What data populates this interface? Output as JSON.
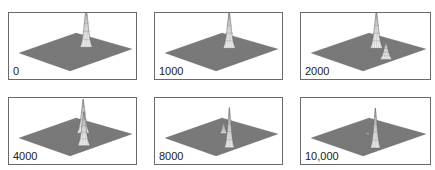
{
  "figure": {
    "panels": [
      {
        "label": "0",
        "peaks": [
          {
            "x": 0.5,
            "y": 0.3,
            "height": 1.0,
            "width": 0.05
          }
        ]
      },
      {
        "label": "1000",
        "peaks": [
          {
            "x": 0.5,
            "y": 0.35,
            "height": 0.95,
            "width": 0.05
          }
        ]
      },
      {
        "label": "2000",
        "peaks": [
          {
            "x": 0.5,
            "y": 0.35,
            "height": 0.95,
            "width": 0.05
          },
          {
            "x": 0.9,
            "y": 0.55,
            "height": 0.45,
            "width": 0.05
          }
        ]
      },
      {
        "label": "4000",
        "peaks": [
          {
            "x": 0.5,
            "y": 0.35,
            "height": 0.85,
            "width": 0.05
          },
          {
            "x": 0.85,
            "y": 0.65,
            "height": 0.85,
            "width": 0.05
          }
        ]
      },
      {
        "label": "8000",
        "peaks": [
          {
            "x": 0.45,
            "y": 0.4,
            "height": 0.3,
            "width": 0.03
          },
          {
            "x": 0.9,
            "y": 0.7,
            "height": 1.0,
            "width": 0.04
          }
        ]
      },
      {
        "label": "10,000",
        "peaks": [
          {
            "x": 0.45,
            "y": 0.45,
            "height": 0.08,
            "width": 0.02
          },
          {
            "x": 0.9,
            "y": 0.72,
            "height": 1.0,
            "width": 0.04
          }
        ]
      }
    ]
  }
}
